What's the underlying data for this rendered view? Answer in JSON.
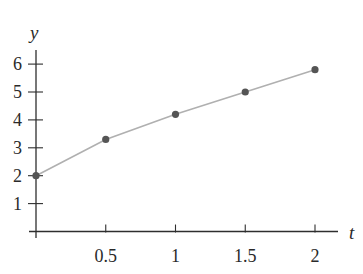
{
  "chart_data": {
    "type": "line",
    "title": "",
    "xlabel": "t",
    "ylabel": "y",
    "x": [
      0,
      0.5,
      1,
      1.5,
      2
    ],
    "series": [
      {
        "name": "y(t)",
        "values": [
          2.0,
          3.3,
          4.2,
          5.0,
          5.8
        ],
        "markers": true,
        "line_color": "#b0b0b0",
        "marker_color": "#555555"
      }
    ],
    "xticks": [
      0.5,
      1,
      1.5,
      2
    ],
    "xtick_labels": [
      "0.5",
      "1",
      "1.5",
      "2"
    ],
    "yticks": [
      1,
      2,
      3,
      4,
      5,
      6
    ],
    "ytick_labels": [
      "1",
      "2",
      "3",
      "4",
      "5",
      "6"
    ],
    "xlim": [
      0,
      2.2
    ],
    "ylim": [
      0,
      6.5
    ],
    "grid": false,
    "legend": null
  }
}
